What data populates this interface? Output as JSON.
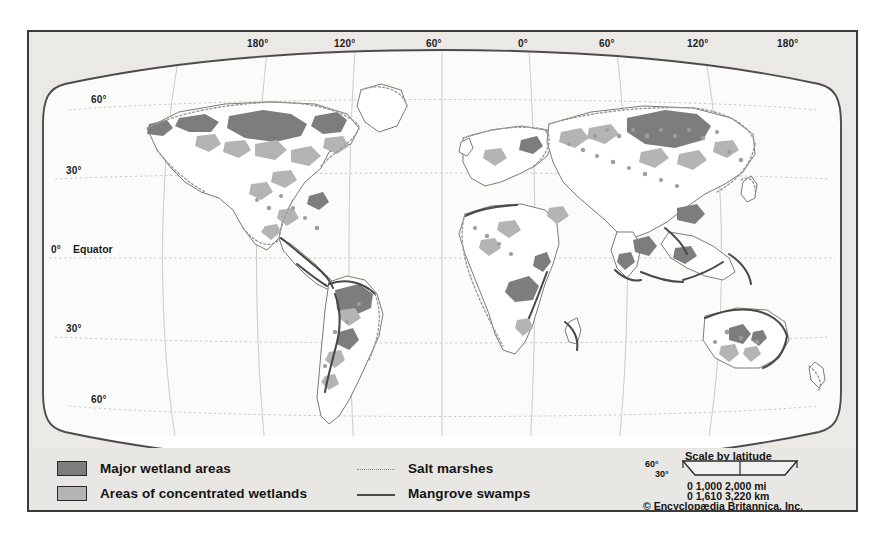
{
  "figure": {
    "type": "world-map",
    "projection": "Robinson"
  },
  "graticule": {
    "longitude_labels": [
      "180°",
      "120°",
      "60°",
      "0°",
      "60°",
      "120°",
      "180°"
    ],
    "latitude_labels_left": [
      "60°",
      "30°",
      "0°",
      "30°",
      "60°"
    ],
    "equator_word": "Equator",
    "latitude_labels_right": [
      "60°",
      "30°"
    ]
  },
  "legend": {
    "area_keys": [
      {
        "label": "Major wetland areas",
        "color": "#7d7d7d"
      },
      {
        "label": "Areas of concentrated wetlands",
        "color": "#b0b0b0"
      }
    ],
    "line_keys": [
      {
        "label": "Salt marshes",
        "style": "dotted",
        "color": "#8d8d8d"
      },
      {
        "label": "Mangrove swamps",
        "style": "solid",
        "color": "#4a4a4a"
      }
    ]
  },
  "scale": {
    "title": "Scale by latitude",
    "lat_top": "60°",
    "lat_bottom": "30°",
    "miles_row": "0      1,000   2,000 mi",
    "km_row": "0      1,610   3,220 km",
    "ticks_mi": [
      "0",
      "1,000",
      "2,000"
    ],
    "unit_mi": "mi",
    "ticks_km": [
      "0",
      "1,610",
      "3,220"
    ],
    "unit_km": "km"
  },
  "credit": {
    "text": "© Encyclopædia Britannica, Inc."
  },
  "colors": {
    "paper": "#eceae7",
    "ocean": "#fbfbfa",
    "frame": "#3a3a3a",
    "outline": "#4c4c4c",
    "graticule": "#c9c5c0",
    "major_wetland": "#7d7d7d",
    "concentrated_wetland": "#b0b0b0",
    "mangrove": "#4a4a4a",
    "salt_marsh": "#9a9a9a"
  }
}
